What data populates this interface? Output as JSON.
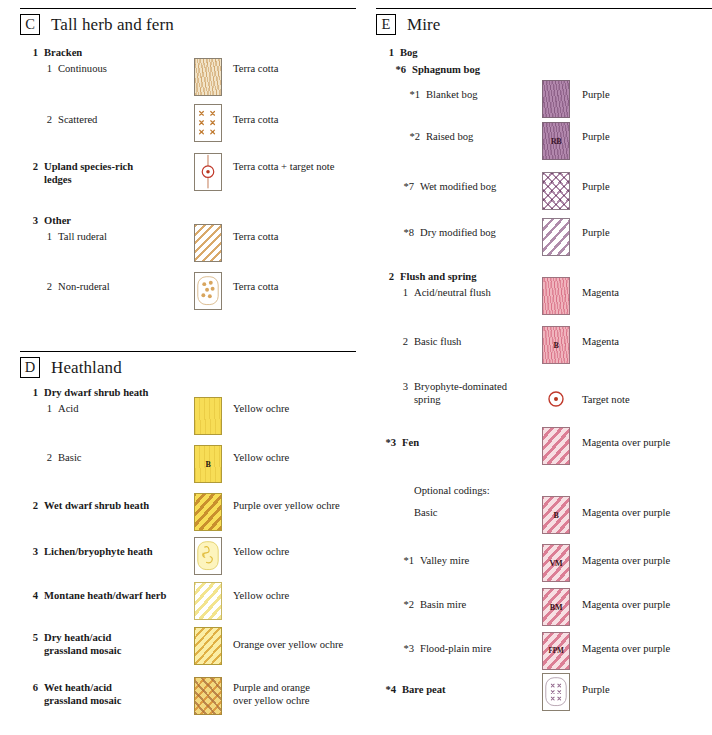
{
  "document": {
    "kind": "habitat-map-legend",
    "columns": [
      {
        "id": "left",
        "sections": [
          {
            "letter": "C",
            "title": "Tall herb and fern",
            "rows": [
              {
                "num": "1",
                "bold_num": true,
                "label": "Bracken",
                "bold_label": true,
                "swatch": null,
                "desc": null
              },
              {
                "num": "1",
                "bold_num": false,
                "label": "Continuous",
                "bold_label": false,
                "swatch": "stipple-terracotta",
                "desc": "Terra cotta"
              },
              {
                "num": "2",
                "bold_num": false,
                "label": "Scattered",
                "bold_label": false,
                "swatch": "crosses-terracotta",
                "desc": "Terra cotta"
              },
              {
                "num": "2",
                "bold_num": true,
                "label": "Upland species-rich\nledges",
                "bold_label": true,
                "swatch": "target-note-terracotta",
                "desc": "Terra cotta + target note"
              },
              {
                "num": "3",
                "bold_num": true,
                "label": "Other",
                "bold_label": true,
                "swatch": null,
                "desc": null
              },
              {
                "num": "1",
                "bold_num": false,
                "label": "Tall ruderal",
                "bold_label": false,
                "swatch": "diagonal-terracotta",
                "desc": "Terra cotta"
              },
              {
                "num": "2",
                "bold_num": false,
                "label": "Non-ruderal",
                "bold_label": false,
                "swatch": "dots-terracotta",
                "desc": "Terra cotta"
              }
            ]
          },
          {
            "letter": "D",
            "title": "Heathland",
            "rows": [
              {
                "num": "1",
                "bold_num": true,
                "label": "Dry dwarf shrub heath",
                "bold_label": true,
                "swatch": null,
                "desc": null
              },
              {
                "num": "1",
                "bold_num": false,
                "label": "Acid",
                "bold_label": false,
                "swatch": "solid-ochre",
                "desc": "Yellow ochre"
              },
              {
                "num": "2",
                "bold_num": false,
                "label": "Basic",
                "bold_label": false,
                "swatch": "solid-ochre-B",
                "code": "B",
                "desc": "Yellow ochre"
              },
              {
                "num": "2",
                "bold_num": true,
                "label": "Wet dwarf shrub heath",
                "bold_label": true,
                "swatch": "diagonal-purple-on-ochre",
                "desc": "Purple over yellow ochre"
              },
              {
                "num": "3",
                "bold_num": true,
                "label": "Lichen/bryophyte heath",
                "bold_label": true,
                "swatch": "squiggle-ochre",
                "desc": "Yellow ochre"
              },
              {
                "num": "4",
                "bold_num": true,
                "label": "Montane heath/dwarf herb",
                "bold_label": true,
                "swatch": "diagonal-light-ochre",
                "desc": "Yellow ochre"
              },
              {
                "num": "5",
                "bold_num": true,
                "label": "Dry heath/acid\ngrassland mosaic",
                "bold_label": true,
                "swatch": "diagonal-orange-on-ochre",
                "desc": "Orange over yellow ochre"
              },
              {
                "num": "6",
                "bold_num": true,
                "label": "Wet heath/acid\ngrassland mosaic",
                "bold_label": true,
                "swatch": "crosshatch-purple-orange-ochre",
                "desc": "Purple and orange\nover yellow ochre"
              }
            ]
          }
        ]
      },
      {
        "id": "right",
        "sections": [
          {
            "letter": "E",
            "title": "Mire",
            "rows": [
              {
                "num": "1",
                "bold_num": true,
                "label": "Bog",
                "bold_label": true,
                "swatch": null,
                "desc": null
              },
              {
                "num": "*6",
                "bold_num": true,
                "label": "Sphagnum bog",
                "bold_label": true,
                "swatch": null,
                "desc": null
              },
              {
                "num": "*1",
                "bold_num": false,
                "label": "Blanket bog",
                "bold_label": false,
                "swatch": "stipple-purple",
                "desc": "Purple"
              },
              {
                "num": "*2",
                "bold_num": false,
                "label": "Raised bog",
                "bold_label": false,
                "swatch": "stipple-purple-RB",
                "code": "RB",
                "desc": "Purple"
              },
              {
                "num": "*7",
                "bold_num": false,
                "label": "Wet modified bog",
                "bold_label": false,
                "swatch": "crosshatch-purple",
                "desc": "Purple"
              },
              {
                "num": "*8",
                "bold_num": false,
                "label": "Dry modified bog",
                "bold_label": false,
                "swatch": "diagonal-purple",
                "desc": "Purple"
              },
              {
                "num": "2",
                "bold_num": true,
                "label": "Flush and spring",
                "bold_label": true,
                "swatch": null,
                "desc": null
              },
              {
                "num": "1",
                "bold_num": false,
                "label": "Acid/neutral flush",
                "bold_label": false,
                "swatch": "stipple-magenta",
                "desc": "Magenta"
              },
              {
                "num": "2",
                "bold_num": false,
                "label": "Basic flush",
                "bold_label": false,
                "swatch": "stipple-magenta-B",
                "code": "B",
                "desc": "Magenta"
              },
              {
                "num": "3",
                "bold_num": false,
                "label": "Bryophyte-dominated\nspring",
                "bold_label": false,
                "swatch": "target-note-only",
                "desc": "Target note"
              },
              {
                "num": "*3",
                "bold_num": true,
                "label": "Fen",
                "bold_label": true,
                "swatch": "diagonal-magenta-purple",
                "desc": "Magenta over purple"
              },
              {
                "num": "",
                "bold_num": false,
                "label": "Optional codings:",
                "bold_label": false,
                "swatch": null,
                "desc": null
              },
              {
                "num": "",
                "bold_num": false,
                "label": "Basic",
                "bold_label": false,
                "swatch": "diagonal-magenta-purple-B",
                "code": "B",
                "desc": "Magenta over purple"
              },
              {
                "num": "*1",
                "bold_num": false,
                "label": "Valley mire",
                "bold_label": false,
                "swatch": "diagonal-magenta-purple-VM",
                "code": "VM",
                "desc": "Magenta over purple"
              },
              {
                "num": "*2",
                "bold_num": false,
                "label": "Basin mire",
                "bold_label": false,
                "swatch": "diagonal-magenta-purple-BM",
                "code": "BM",
                "desc": "Magenta over purple"
              },
              {
                "num": "*3",
                "bold_num": false,
                "label": "Flood-plain mire",
                "bold_label": false,
                "swatch": "diagonal-magenta-purple-FPM",
                "code": "FPM",
                "desc": "Magenta over purple"
              },
              {
                "num": "*4",
                "bold_num": true,
                "label": "Bare peat",
                "bold_label": true,
                "swatch": "crosses-purple-rounded",
                "desc": "Purple"
              }
            ]
          }
        ]
      }
    ]
  },
  "colors": {
    "terra_cotta": "#c08a4a",
    "terra_cotta_light": "#e8d5b0",
    "yellow_ochre": "#f5dc5a",
    "yellow_ochre_light": "#fbf3c0",
    "orange": "#e0922f",
    "purple": "#9a6b96",
    "purple_light": "#c9a8c4",
    "magenta": "#e08a9a",
    "magenta_deep": "#d4566e",
    "target_note_red": "#c0392b",
    "swatch_border": "#8a8070",
    "text": "#1a1a1a"
  }
}
